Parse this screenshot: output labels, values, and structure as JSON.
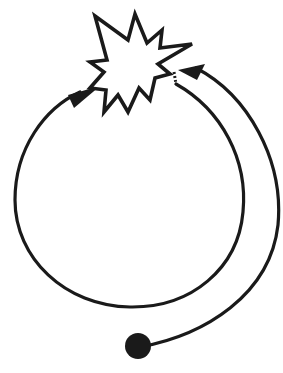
{
  "diagram": {
    "type": "cyclic-flow-illustration",
    "stroke_color": "#1a1a1a",
    "background": "#ffffff",
    "elements": [
      {
        "id": "explosion-burst",
        "shape": "star-burst",
        "description": "jagged explosion/collision shape at top"
      },
      {
        "id": "loop-circle",
        "shape": "circular-arrow",
        "description": "large loop leaving the burst's right side (dotted start), going around and arriving at the burst's left side with an arrowhead"
      },
      {
        "id": "incoming-path",
        "shape": "curved-arrow",
        "description": "curved path from the black dot at bottom, sweeping up the right side into the burst with an arrowhead"
      },
      {
        "id": "start-dot",
        "shape": "filled-circle",
        "description": "solid black starting point at bottom"
      }
    ],
    "labels": []
  }
}
